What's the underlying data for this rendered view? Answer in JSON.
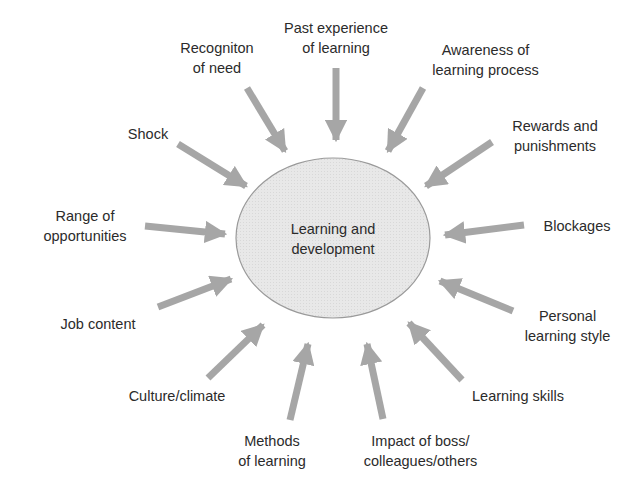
{
  "diagram": {
    "type": "radial-influence-diagram",
    "center": {
      "line1": "Learning and",
      "line2": "development",
      "fill": "#e6e6e6",
      "stroke": "#9a9a9a"
    },
    "arrow_color": "#a6a6a6",
    "factors": [
      {
        "id": "recognition",
        "line1": "Recogniton",
        "line2": "of need"
      },
      {
        "id": "past-experience",
        "line1": "Past experience",
        "line2": "of learning"
      },
      {
        "id": "awareness",
        "line1": "Awareness of",
        "line2": "learning process"
      },
      {
        "id": "shock",
        "line1": "Shock",
        "line2": ""
      },
      {
        "id": "rewards",
        "line1": "Rewards and",
        "line2": "punishments"
      },
      {
        "id": "range",
        "line1": "Range of",
        "line2": "opportunities"
      },
      {
        "id": "blockages",
        "line1": "Blockages",
        "line2": ""
      },
      {
        "id": "job-content",
        "line1": "Job content",
        "line2": ""
      },
      {
        "id": "personal-style",
        "line1": "Personal",
        "line2": "learning style"
      },
      {
        "id": "culture",
        "line1": "Culture/climate",
        "line2": ""
      },
      {
        "id": "learning-skills",
        "line1": "Learning skills",
        "line2": ""
      },
      {
        "id": "methods",
        "line1": "Methods",
        "line2": "of learning"
      },
      {
        "id": "impact-boss",
        "line1": "Impact of boss/",
        "line2": "colleagues/others"
      }
    ]
  }
}
